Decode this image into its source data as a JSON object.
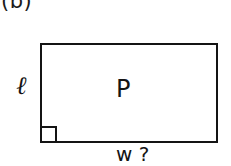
{
  "figure": {
    "subfigure_label": "(b)",
    "background_color": "#ffffff",
    "stroke_color": "#141414",
    "text_color": "#141414"
  },
  "diagram": {
    "type": "rectangle-geometry",
    "shape_name": "rectangle",
    "area_label": "P",
    "height_label": "ℓ",
    "width_label": "w ?",
    "right_angle_marker": "right-angle-square",
    "labels": {
      "interior": "P",
      "left_side": "ℓ",
      "bottom_side": "w ?"
    }
  }
}
